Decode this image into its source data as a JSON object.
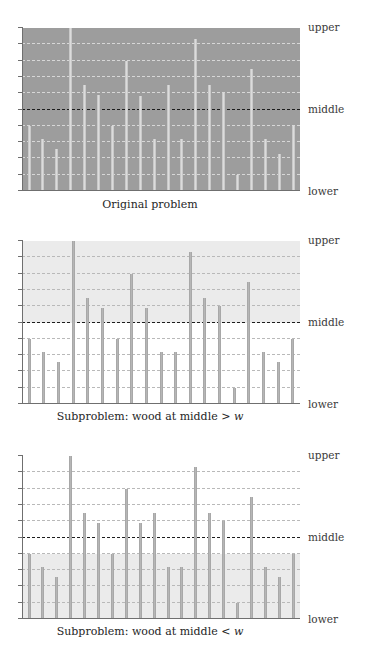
{
  "figure": {
    "axis_labels": {
      "upper": "upper",
      "middle": "middle",
      "lower": "lower"
    },
    "colors": {
      "bar": "#b6b6b6",
      "bar_on_dark": "#dcdcdc",
      "shade_dark": "#9d9d9d",
      "shade_light": "#ebebeb",
      "grid": "#b9b9b9",
      "middle_line": "#1d1d1d",
      "axis": "#6f6f6f",
      "background": "#ffffff"
    }
  },
  "chart_data": [
    {
      "type": "bar",
      "title": "Original problem",
      "xlabel": "",
      "ylabel": "",
      "ylim": [
        0,
        10
      ],
      "grid": true,
      "gridlines": [
        1,
        2,
        3,
        4,
        5,
        6,
        7,
        8,
        9
      ],
      "reference_lines": [
        {
          "label": "middle",
          "value": 5
        }
      ],
      "shaded_region": {
        "from": 0,
        "to": 10,
        "shade": "dark"
      },
      "tick_labels_right": [
        "upper",
        "middle",
        "lower"
      ],
      "categories": [
        "1",
        "2",
        "3",
        "4",
        "5",
        "6",
        "7",
        "8",
        "9",
        "10",
        "11",
        "12",
        "13",
        "14",
        "15",
        "16",
        "17",
        "18",
        "19"
      ],
      "values": [
        4.0,
        3.2,
        2.6,
        10.0,
        6.5,
        5.9,
        4.0,
        8.0,
        5.8,
        3.2,
        6.5,
        3.2,
        9.3,
        6.5,
        6.0,
        1.0,
        7.5,
        3.2,
        2.3,
        4.0
      ]
    },
    {
      "type": "bar",
      "title": "Subproblem: wood at middle > w",
      "title_parts": {
        "prefix": "Subproblem: wood at middle > ",
        "italic": "w"
      },
      "xlabel": "",
      "ylabel": "",
      "ylim": [
        0,
        10
      ],
      "grid": true,
      "gridlines": [
        1,
        2,
        3,
        4,
        5,
        6,
        7,
        8,
        9
      ],
      "reference_lines": [
        {
          "label": "middle",
          "value": 5
        }
      ],
      "shaded_region": {
        "from": 5,
        "to": 10,
        "shade": "light"
      },
      "tick_labels_right": [
        "upper",
        "middle",
        "lower"
      ],
      "categories": [
        "1",
        "2",
        "3",
        "4",
        "5",
        "6",
        "7",
        "8",
        "9",
        "10",
        "11",
        "12",
        "13",
        "14",
        "15",
        "16",
        "17",
        "18",
        "19",
        "20"
      ],
      "values": [
        4.0,
        3.2,
        2.6,
        10.0,
        6.5,
        5.9,
        4.0,
        8.0,
        5.9,
        3.2,
        3.2,
        9.3,
        6.5,
        6.0,
        1.0,
        7.5,
        3.2,
        2.6,
        4.0
      ]
    },
    {
      "type": "bar",
      "title": "Subproblem: wood at middle < w",
      "title_parts": {
        "prefix": "Subproblem: wood at middle < ",
        "italic": "w"
      },
      "xlabel": "",
      "ylabel": "",
      "ylim": [
        0,
        10
      ],
      "grid": true,
      "gridlines": [
        1,
        2,
        3,
        4,
        5,
        6,
        7,
        8,
        9
      ],
      "reference_lines": [
        {
          "label": "middle",
          "value": 5
        }
      ],
      "shaded_region": {
        "from": 0,
        "to": 4,
        "shade": "light"
      },
      "tick_labels_right": [
        "upper",
        "middle",
        "lower"
      ],
      "categories": [
        "1",
        "2",
        "3",
        "4",
        "5",
        "6",
        "7",
        "8",
        "9",
        "10",
        "11",
        "12",
        "13",
        "14",
        "15",
        "16",
        "17",
        "18",
        "19"
      ],
      "values": [
        4.0,
        3.2,
        2.6,
        10.0,
        6.5,
        5.9,
        4.0,
        8.0,
        5.9,
        6.5,
        3.2,
        3.2,
        9.3,
        6.5,
        6.0,
        1.0,
        7.5,
        3.2,
        2.6,
        4.0
      ]
    }
  ],
  "panels": [
    {
      "caption": "Original problem",
      "caption_prefix": "Original problem",
      "caption_italic": ""
    },
    {
      "caption": "Subproblem: wood at middle > w",
      "caption_prefix": "Subproblem: wood at middle > ",
      "caption_italic": "w"
    },
    {
      "caption": "Subproblem: wood at middle < w",
      "caption_prefix": "Subproblem: wood at middle < ",
      "caption_italic": "w"
    }
  ]
}
